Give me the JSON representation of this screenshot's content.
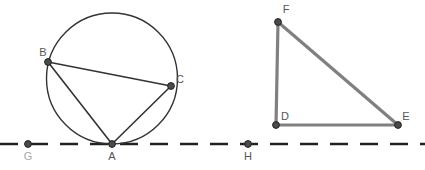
{
  "figure": {
    "background_color": "#ffffff",
    "width": 425,
    "height": 170
  },
  "styles": {
    "circle_stroke": "#333333",
    "circle_stroke_width": 1.4,
    "chord_stroke": "#333333",
    "chord_stroke_width": 1.6,
    "triangle_stroke": "#808080",
    "triangle_stroke_width": 3.2,
    "dashed_line_stroke": "#222222",
    "dashed_line_stroke_width": 2.4,
    "dash_pattern": "18 12",
    "vertex_fill": "#4a4a4a",
    "vertex_stroke": "#222222",
    "vertex_radius": 3.4,
    "label_color": "#555555",
    "label_color_dim": "#a8a8a8",
    "label_font_size": 11
  },
  "dashed_line": {
    "name": "baseline",
    "y": 144,
    "x_start": 0,
    "x_end": 425
  },
  "circle": {
    "name": "main-circle",
    "cx": 112,
    "cy": 78.5,
    "r": 65.5
  },
  "points": [
    {
      "id": "A",
      "label": "A",
      "x": 112,
      "y": 144,
      "label_x": 112,
      "label_y": 160,
      "dim": false
    },
    {
      "id": "B",
      "label": "B",
      "x": 48,
      "y": 62,
      "label_x": 43,
      "label_y": 56,
      "dim": false
    },
    {
      "id": "C",
      "label": "C",
      "x": 171,
      "y": 86,
      "label_x": 180,
      "label_y": 83,
      "dim": false
    },
    {
      "id": "D",
      "label": "D",
      "x": 276,
      "y": 125,
      "label_x": 285,
      "label_y": 120,
      "dim": false
    },
    {
      "id": "E",
      "label": "E",
      "x": 398,
      "y": 125,
      "label_x": 406,
      "label_y": 120,
      "dim": false
    },
    {
      "id": "F",
      "label": "F",
      "x": 278,
      "y": 22,
      "label_x": 286,
      "label_y": 13,
      "dim": false
    },
    {
      "id": "G",
      "label": "G",
      "x": 28,
      "y": 144,
      "label_x": 28,
      "label_y": 160,
      "dim": true
    },
    {
      "id": "H",
      "label": "H",
      "x": 248,
      "y": 144,
      "label_x": 248,
      "label_y": 160,
      "dim": false
    }
  ],
  "chords": [
    {
      "name": "chord-BC",
      "x1": 48,
      "y1": 62,
      "x2": 171,
      "y2": 86
    },
    {
      "name": "chord-BA",
      "x1": 48,
      "y1": 62,
      "x2": 112,
      "y2": 144
    },
    {
      "name": "chord-AC",
      "x1": 112,
      "y1": 144,
      "x2": 171,
      "y2": 86
    }
  ],
  "triangle": {
    "name": "triangle-DEF",
    "vertices": "276,125 398,125 278,22",
    "sides": [
      {
        "name": "side-DF",
        "x1": 276,
        "y1": 125,
        "x2": 278,
        "y2": 22
      },
      {
        "name": "side-FE",
        "x1": 278,
        "y1": 22,
        "x2": 398,
        "y2": 125
      },
      {
        "name": "side-DE",
        "x1": 276,
        "y1": 125,
        "x2": 398,
        "y2": 125
      }
    ]
  }
}
